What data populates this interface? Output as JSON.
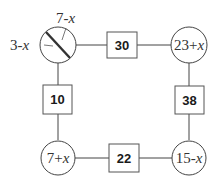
{
  "diagram": {
    "circles": [
      {
        "id": "top-left",
        "label": null,
        "sector_labels": {
          "left": "3-x",
          "top": "7-x"
        }
      },
      {
        "id": "top-right",
        "label": "23+x"
      },
      {
        "id": "bottom-left",
        "label": "7+x"
      },
      {
        "id": "bottom-right",
        "label": "15-x"
      }
    ],
    "boxes": [
      {
        "id": "top",
        "value": "30",
        "connects": [
          "top-left",
          "top-right"
        ]
      },
      {
        "id": "left",
        "value": "10",
        "connects": [
          "top-left",
          "bottom-left"
        ]
      },
      {
        "id": "right",
        "value": "38",
        "connects": [
          "top-right",
          "bottom-right"
        ]
      },
      {
        "id": "bottom",
        "value": "22",
        "connects": [
          "bottom-left",
          "bottom-right"
        ]
      }
    ]
  }
}
